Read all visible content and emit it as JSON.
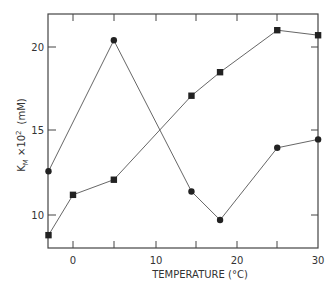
{
  "chart_data": {
    "type": "line",
    "title": "",
    "xlabel": "TEMPERATURE (°C)",
    "ylabel": "K_M ×10^2 (mM)",
    "xlim": [
      -3,
      30
    ],
    "ylim": [
      8.0,
      22.0
    ],
    "x_ticks": [
      0,
      10,
      20,
      30
    ],
    "x_tick_labels": [
      "0",
      "10",
      "20",
      "30"
    ],
    "y_ticks": [
      10,
      15,
      20
    ],
    "y_tick_labels": [
      "10",
      "15",
      "20"
    ],
    "grid": false,
    "legend": null,
    "series": [
      {
        "name": "circles",
        "marker": "circle",
        "x": [
          -3,
          5,
          14.5,
          18,
          25,
          30
        ],
        "y": [
          12.6,
          20.4,
          11.4,
          9.7,
          14.0,
          14.5
        ]
      },
      {
        "name": "squares",
        "marker": "square",
        "x": [
          -3,
          0,
          5,
          14.5,
          18,
          25,
          30
        ],
        "y": [
          8.8,
          11.2,
          12.1,
          17.1,
          18.5,
          21.0,
          20.7
        ]
      }
    ]
  },
  "labels": {
    "xlabel": "TEMPERATURE (°C)",
    "ylabel_main": "K",
    "ylabel_sub": "M",
    "ylabel_mid": " ×10",
    "ylabel_sup": "2",
    "ylabel_unit": "(mM)",
    "xt0": "0",
    "xt1": "10",
    "xt2": "20",
    "xt3": "30",
    "yt0": "10",
    "yt1": "15",
    "yt2": "20"
  }
}
